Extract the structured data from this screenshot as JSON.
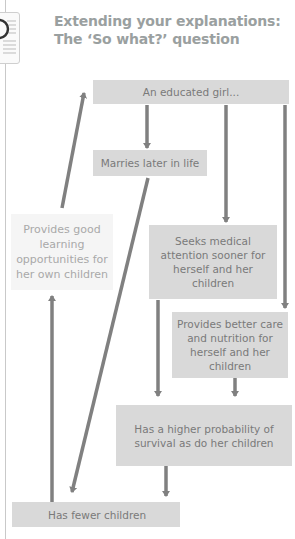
{
  "header": {
    "title_line1": "Extending your explanations:",
    "title_line2": "The ‘So what?’ question",
    "icon": "worksheet-card-icon"
  },
  "diagram": {
    "nodes": [
      {
        "id": "educated-girl",
        "label": "An educated girl..."
      },
      {
        "id": "marries-later",
        "label": "Marries later in life"
      },
      {
        "id": "learning-opportunities",
        "label": "Provides good learning opportunities for her own children"
      },
      {
        "id": "seeks-medical",
        "label": "Seeks medical attention sooner for herself and her children"
      },
      {
        "id": "better-care",
        "label": "Provides better care and nutrition for herself and her children"
      },
      {
        "id": "higher-survival",
        "label": "Has a higher probability of survival as do her children"
      },
      {
        "id": "fewer-children",
        "label": "Has fewer children"
      }
    ],
    "edges": [
      {
        "from": "educated-girl",
        "to": "marries-later"
      },
      {
        "from": "educated-girl",
        "to": "seeks-medical"
      },
      {
        "from": "educated-girl",
        "to": "better-care"
      },
      {
        "from": "marries-later",
        "to": "fewer-children"
      },
      {
        "from": "seeks-medical",
        "to": "higher-survival"
      },
      {
        "from": "better-care",
        "to": "higher-survival"
      },
      {
        "from": "higher-survival",
        "to": "fewer-children"
      },
      {
        "from": "fewer-children",
        "to": "learning-opportunities"
      },
      {
        "from": "learning-opportunities",
        "to": "educated-girl"
      }
    ],
    "colors": {
      "box": "#d9d9d9",
      "box_light": "#f5f5f5",
      "arrow": "#808080",
      "text": "#7a7a7a",
      "title": "#9aa0a0"
    }
  }
}
